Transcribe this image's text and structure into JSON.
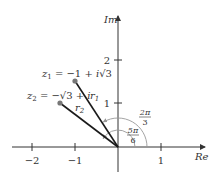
{
  "diagram": {
    "axes": {
      "x_label": "Re",
      "y_label": "Im",
      "x_ticks": [
        {
          "value": -2,
          "label": "−2"
        },
        {
          "value": -1,
          "label": "−1"
        },
        {
          "value": 1,
          "label": "1"
        }
      ],
      "y_ticks": [
        {
          "value": 1,
          "label": "1"
        },
        {
          "value": 2,
          "label": "2"
        }
      ]
    },
    "points": [
      {
        "id": "z1",
        "label_lhs": "z",
        "label_sub": "1",
        "label_rhs": " = −1 + ",
        "label_i": "i",
        "label_sqrt": "√3",
        "x": -1,
        "y": 1.732,
        "radius_label": "r",
        "radius_sub": "1"
      },
      {
        "id": "z2",
        "label_lhs": "z",
        "label_sub": "2",
        "label_rhs": " = −√3 + ",
        "label_i": "i",
        "x": -1.732,
        "y": 1,
        "radius_label": "r",
        "radius_sub": "2"
      }
    ],
    "angles": [
      {
        "id": "arg_z1",
        "num": "2π",
        "den": "3",
        "value_rad": 2.0944
      },
      {
        "id": "arg_z2",
        "num": "5π",
        "den": "6",
        "value_rad": 2.618
      }
    ],
    "colors": {
      "axis": "#333333",
      "vector": "#1a1a1a",
      "point": "#777777",
      "arc": "#999999"
    }
  }
}
